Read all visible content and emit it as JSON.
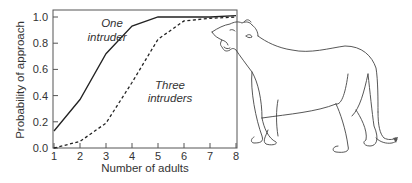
{
  "chart_data": {
    "type": "line",
    "title": "",
    "xlabel": "Number of adults",
    "ylabel": "Probability of approach",
    "x": [
      1,
      2,
      3,
      4,
      5,
      6,
      7,
      8
    ],
    "xticks": [
      "1",
      "2",
      "3",
      "4",
      "5",
      "6",
      "7",
      "8"
    ],
    "yticks": [
      "0.0",
      "0.2",
      "0.4",
      "0.6",
      "0.8",
      "1.0"
    ],
    "xlim": [
      1,
      8
    ],
    "ylim": [
      0,
      1.0
    ],
    "grid": false,
    "legend": "none (inline annotations)",
    "series": [
      {
        "name": "One intruder",
        "style": "solid",
        "values": [
          0.13,
          0.37,
          0.72,
          0.93,
          1.0,
          1.0,
          1.0,
          1.01
        ]
      },
      {
        "name": "Three intruders",
        "style": "dashed",
        "values": [
          0.0,
          0.05,
          0.19,
          0.5,
          0.83,
          0.97,
          0.99,
          1.0
        ]
      }
    ],
    "annotations": [
      {
        "text_line1": "One",
        "text_line2": "intruder",
        "near_series": "One intruder"
      },
      {
        "text_line1": "Three",
        "text_line2": "intruders",
        "near_series": "Three intruders"
      }
    ]
  },
  "illustration": {
    "subject": "roaring lioness line drawing",
    "icon": "lioness-illustration"
  }
}
